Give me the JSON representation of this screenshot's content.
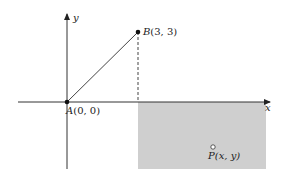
{
  "diagram": {
    "axes": {
      "x_label": "x",
      "y_label": "y"
    },
    "points": [
      {
        "id": "A",
        "label": "A(0, 0)",
        "name": "A",
        "coords": "(0, 0)"
      },
      {
        "id": "B",
        "label": "B(3, 3)",
        "name": "B",
        "coords": "(3, 3)"
      },
      {
        "id": "P",
        "label": "P(x, y)",
        "name": "P",
        "coords": "(x, y)"
      }
    ],
    "segments": [
      {
        "from": "A",
        "to": "B",
        "style": "solid"
      },
      {
        "from": "B",
        "to": "x-axis at x=3",
        "style": "dashed"
      }
    ],
    "shaded_region": {
      "description": "x > 3, y < 0",
      "color": "#cfcfcf"
    }
  }
}
